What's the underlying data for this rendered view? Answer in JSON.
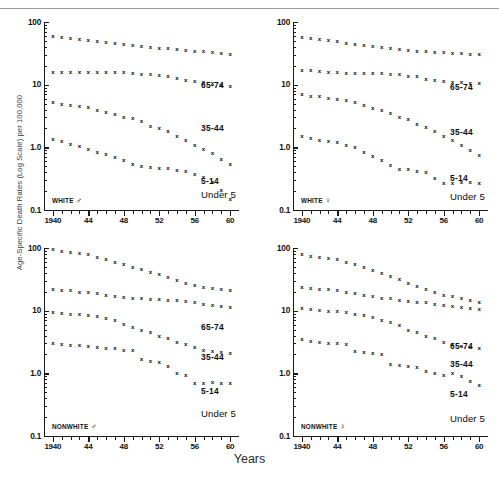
{
  "figure": {
    "ylabel": "Age-Specific Death Rates (Log Scale) per 100,000",
    "xlabel": "Years"
  },
  "axis": {
    "y_ticks": [
      "100",
      "10",
      "1.0",
      "0.1"
    ],
    "y_values": [
      100,
      10,
      1.0,
      0.1
    ],
    "x_ticks": [
      "1940",
      "44",
      "48",
      "52",
      "56",
      "60"
    ],
    "x_values": [
      1940,
      1944,
      1948,
      1952,
      1956,
      1960
    ]
  },
  "series_labels": {
    "a": "65-74",
    "b": "35-44",
    "c": "5-14",
    "d": "Under 5"
  },
  "panels": [
    {
      "id": "white-male",
      "tag": "WHITE",
      "sex_symbol": "♂"
    },
    {
      "id": "white-female",
      "tag": "WHITE",
      "sex_symbol": "♀"
    },
    {
      "id": "nonwhite-male",
      "tag": "NONWHITE",
      "sex_symbol": "♂"
    },
    {
      "id": "nonwhite-female",
      "tag": "NONWHITE",
      "sex_symbol": "♀"
    }
  ],
  "chart_data": {
    "type": "scatter",
    "title": "",
    "xlabel": "Years",
    "ylabel": "Age-Specific Death Rates (Log Scale) per 100,000",
    "yscale": "log",
    "ylim": [
      0.1,
      100
    ],
    "xlim": [
      1939,
      1961
    ],
    "grid": false,
    "legend": "inline-right",
    "marker": "x",
    "x": [
      1940,
      1941,
      1942,
      1943,
      1944,
      1945,
      1946,
      1947,
      1948,
      1949,
      1950,
      1951,
      1952,
      1953,
      1954,
      1955,
      1956,
      1957,
      1958,
      1959,
      1960
    ],
    "panels": [
      {
        "name": "WHITE ♂",
        "series": [
          {
            "name": "65-74",
            "values": [
              60,
              57,
              55,
              54,
              52,
              50,
              48,
              46,
              44,
              43,
              41,
              40,
              39,
              38,
              37,
              36,
              35,
              34,
              33,
              32,
              31
            ]
          },
          {
            "name": "35-44",
            "values": [
              16,
              16,
              16,
              16,
              16,
              16,
              16,
              16,
              16,
              15.5,
              15,
              15,
              14.5,
              14,
              13,
              12,
              11.5,
              11,
              10.5,
              10,
              9.5
            ]
          },
          {
            "name": "5-14",
            "values": [
              5.2,
              5.0,
              4.8,
              4.6,
              4.4,
              4.0,
              3.6,
              3.4,
              3.1,
              2.9,
              2.6,
              2.2,
              2.0,
              1.8,
              1.5,
              1.3,
              1.1,
              0.95,
              0.8,
              0.65,
              0.55
            ]
          },
          {
            "name": "Under 5",
            "values": [
              1.35,
              1.25,
              1.15,
              1.05,
              0.95,
              0.85,
              0.78,
              0.7,
              0.62,
              0.55,
              0.5,
              0.48,
              0.47,
              0.46,
              0.44,
              0.42,
              0.38,
              0.34,
              0.28,
              0.21,
              0.15
            ]
          }
        ]
      },
      {
        "name": "WHITE ♀",
        "series": [
          {
            "name": "65-74",
            "values": [
              58,
              55,
              53,
              52,
              50,
              47,
              45,
              43,
              41,
              40,
              38,
              37,
              36,
              35,
              34,
              33,
              33,
              32,
              32,
              31,
              31
            ]
          },
          {
            "name": "35-44",
            "values": [
              17,
              17,
              16.5,
              16,
              16,
              15.5,
              15.5,
              15.5,
              15.5,
              15.5,
              15,
              15,
              14,
              13.5,
              12.5,
              12,
              11.5,
              11,
              11,
              10.5,
              10.5
            ]
          },
          {
            "name": "5-14",
            "values": [
              7.0,
              6.7,
              6.5,
              6.2,
              6.0,
              5.7,
              5.2,
              4.8,
              4.3,
              3.9,
              3.5,
              3.1,
              2.8,
              2.4,
              2.1,
              1.8,
              1.5,
              1.3,
              1.1,
              0.9,
              0.75
            ]
          },
          {
            "name": "Under 5",
            "values": [
              1.5,
              1.4,
              1.3,
              1.25,
              1.2,
              1.1,
              1.0,
              0.85,
              0.72,
              0.62,
              0.52,
              0.45,
              0.45,
              0.42,
              0.4,
              0.32,
              0.27,
              0.27,
              0.28,
              0.28,
              0.27
            ]
          }
        ]
      },
      {
        "name": "NONWHITE ♂",
        "series": [
          {
            "name": "65-74",
            "values": [
              95,
              88,
              85,
              82,
              80,
              72,
              66,
              60,
              55,
              50,
              46,
              42,
              38,
              34,
              31,
              28,
              26,
              24,
              23,
              22,
              21
            ]
          },
          {
            "name": "35-44",
            "values": [
              22,
              21,
              21,
              20,
              20,
              19,
              18,
              17,
              16.5,
              16,
              16,
              15.5,
              15.5,
              15,
              15,
              14.5,
              14,
              13,
              12.5,
              12,
              11.5
            ]
          },
          {
            "name": "5-14",
            "values": [
              9.5,
              9.2,
              9.0,
              8.8,
              8.5,
              8.2,
              7.5,
              7.0,
              6.2,
              5.5,
              5.0,
              4.5,
              4.0,
              3.6,
              3.2,
              2.9,
              2.6,
              2.4,
              2.3,
              2.2,
              2.1
            ]
          },
          {
            "name": "Under 5",
            "values": [
              3.0,
              2.9,
              2.8,
              2.8,
              2.7,
              2.6,
              2.5,
              2.5,
              2.4,
              2.4,
              1.7,
              1.6,
              1.5,
              1.3,
              1.0,
              0.95,
              0.7,
              0.7,
              0.72,
              0.7,
              0.7
            ]
          }
        ]
      },
      {
        "name": "NONWHITE ♀",
        "series": [
          {
            "name": "65-74",
            "values": [
              80,
              75,
              72,
              70,
              66,
              60,
              55,
              50,
              45,
              40,
              36,
              32,
              28,
              25,
              22,
              20,
              18,
              17,
              16,
              15,
              14
            ]
          },
          {
            "name": "35-44",
            "values": [
              24,
              23,
              22,
              22,
              21,
              20,
              19,
              18,
              17,
              16,
              16,
              15,
              14.5,
              14,
              13.5,
              13,
              12.5,
              12,
              11.5,
              11,
              10.5
            ]
          },
          {
            "name": "5-14",
            "values": [
              11,
              10.5,
              10.2,
              10,
              9.8,
              9.5,
              9.0,
              8.5,
              8.0,
              7.2,
              6.5,
              5.8,
              5.0,
              4.5,
              4.0,
              3.6,
              3.2,
              2.9,
              2.7,
              2.6,
              2.5
            ]
          },
          {
            "name": "Under 5",
            "values": [
              3.5,
              3.3,
              3.2,
              3.1,
              3.0,
              2.9,
              2.3,
              2.2,
              2.1,
              2.0,
              1.4,
              1.35,
              1.3,
              1.25,
              1.1,
              1.0,
              0.95,
              1.0,
              0.9,
              0.75,
              0.65
            ]
          }
        ]
      }
    ]
  }
}
